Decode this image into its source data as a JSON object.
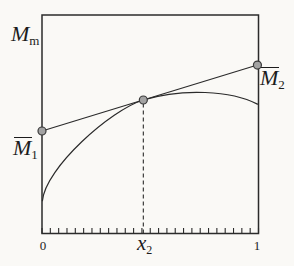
{
  "figure": {
    "background_color": "#faf9f6",
    "line_color": "#2b2b2b",
    "text_color": "#1c1c1c",
    "dot_fill": "#a3a3a3",
    "dot_stroke": "#3a3a3a"
  },
  "labels": {
    "axis_quantity": {
      "base": "M",
      "sub": "m"
    },
    "partial_left": {
      "base": "M",
      "sub": "1",
      "overline": true
    },
    "partial_right": {
      "base": "M",
      "sub": "2",
      "overline": true
    },
    "tick_zero": "0",
    "tick_x2": {
      "base": "x",
      "sub": "2"
    },
    "tick_one": "1"
  },
  "chart_data": {
    "type": "line",
    "title": "",
    "xlabel": "",
    "ylabel": "Mm",
    "x_range": [
      0,
      1
    ],
    "y_range": [
      0,
      1
    ],
    "grid": false,
    "legend": false,
    "x_ticks_labeled": [
      {
        "label": "0",
        "x": 0
      },
      {
        "label": "x2",
        "x": 0.468
      },
      {
        "label": "1",
        "x": 1
      }
    ],
    "minor_tick_intervals": 26,
    "series": [
      {
        "name": "Mm-curve",
        "type": "bezier",
        "start": [
          0.002,
          0.15
        ],
        "segments": [
          {
            "c1": [
              0.015,
              0.3
            ],
            "c2": [
              0.318,
              0.566
            ],
            "end": [
              0.468,
              0.611
            ]
          },
          {
            "c1": [
              0.648,
              0.666
            ],
            "c2": [
              0.875,
              0.654
            ],
            "end": [
              0.995,
              0.592
            ]
          }
        ]
      },
      {
        "name": "tangent-line",
        "type": "segment",
        "points": [
          [
            0.0,
            0.469
          ],
          [
            0.995,
            0.771
          ]
        ]
      }
    ],
    "marked_points": [
      {
        "name": "M1-intercept",
        "x": 0.0,
        "y": 0.469
      },
      {
        "name": "tangent-point",
        "x": 0.468,
        "y": 0.611
      },
      {
        "name": "M2-intercept",
        "x": 0.995,
        "y": 0.771
      }
    ],
    "dashed_guide": {
      "x": 0.468,
      "y_from": 0,
      "y_to": 0.611
    }
  }
}
